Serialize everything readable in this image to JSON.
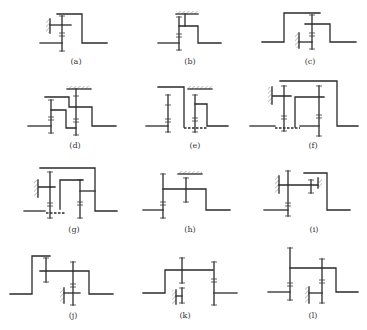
{
  "figure": {
    "type": "kinematic gear train schematics",
    "panel_count": 12,
    "panels": [
      {
        "id": "a",
        "label": "(a)"
      },
      {
        "id": "b",
        "label": "(b)"
      },
      {
        "id": "c",
        "label": "(c)"
      },
      {
        "id": "d",
        "label": "(d)"
      },
      {
        "id": "e",
        "label": "(e)"
      },
      {
        "id": "f",
        "label": "(f)"
      },
      {
        "id": "g",
        "label": "(g)"
      },
      {
        "id": "h",
        "label": "(h)"
      },
      {
        "id": "i",
        "label": "(i)"
      },
      {
        "id": "j",
        "label": "(j)"
      },
      {
        "id": "k",
        "label": "(k)"
      },
      {
        "id": "l",
        "label": "(l)"
      }
    ]
  },
  "colors": {
    "line": "#2a2a2a",
    "background": "#ffffff",
    "hatch": "#555555"
  }
}
